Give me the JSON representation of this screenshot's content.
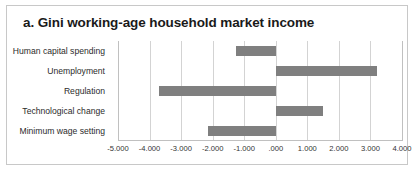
{
  "chart_data": {
    "type": "bar",
    "orientation": "horizontal",
    "title": "a. Gini working-age household market income",
    "xlabel": "",
    "ylabel": "",
    "categories": [
      "Human capital spending",
      "Unemployment",
      "Regulation",
      "Technological change",
      "Minimum wage setting"
    ],
    "values": [
      -1.25,
      3.2,
      -3.7,
      1.5,
      -2.15
    ],
    "series": [
      {
        "name": "Contribution",
        "values": [
          -1.25,
          3.2,
          -3.7,
          1.5,
          -2.15
        ]
      }
    ],
    "xlim": [
      -5.0,
      4.0
    ],
    "xticks": [
      -5,
      -4,
      -3,
      -2,
      -1,
      0,
      1,
      2,
      3,
      4
    ],
    "xticklabels": [
      "-5.000",
      "-4.000",
      "-3.000",
      "-2.000",
      "-1.000",
      ".000",
      "1.000",
      "2.000",
      "3.000",
      "4.000"
    ],
    "grid": true,
    "grid_axis": "x",
    "legend": false,
    "legend_position": "none",
    "bar_color": "#7f7f7f",
    "gridline_color": "#d3d3d3",
    "border_color": "#c8c8c8",
    "background_color": "#ffffff"
  }
}
